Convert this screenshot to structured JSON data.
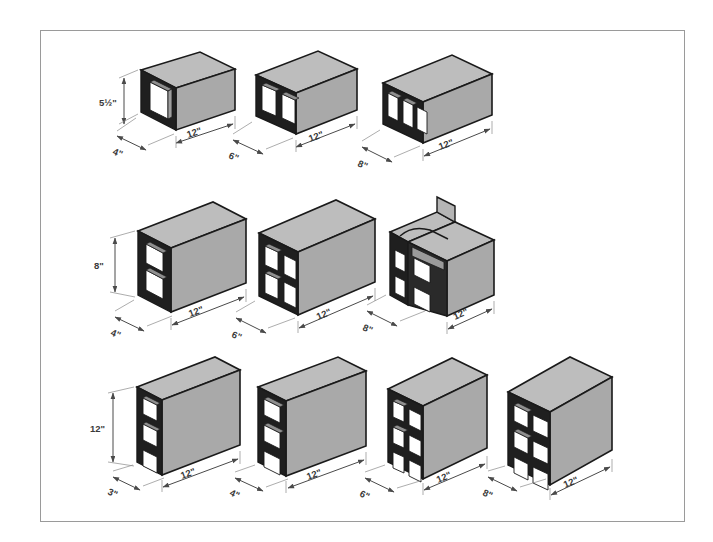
{
  "figure": {
    "frame_color": "#9a9a9a",
    "background_color": "#ffffff",
    "block_face_color": "#a9a9a9",
    "block_top_color": "#bdbdbd",
    "block_side_color": "#9e9e9e",
    "block_outline_color": "#1a1a1a",
    "dimension_text_color": "#3a3a3a"
  },
  "rows": [
    {
      "id": "row-1",
      "orientation": "horizontal",
      "height_label": "5 1/2\"",
      "blocks": [
        {
          "id": "r1-b1",
          "width_label": "4\"",
          "length_label": "12\"",
          "height_label": "5 1/2\"",
          "cells": 1,
          "cell_columns": 1,
          "cell_rows": 1,
          "type": "stretcher"
        },
        {
          "id": "r1-b2",
          "width_label": "6\"",
          "length_label": "12\"",
          "height_label": "5 1/2\"",
          "cells": 2,
          "cell_columns": 2,
          "cell_rows": 1,
          "type": "stretcher"
        },
        {
          "id": "r1-b3",
          "width_label": "8\"",
          "length_label": "12\"",
          "height_label": "5 1/2\"",
          "cells": 3,
          "cell_columns": 3,
          "cell_rows": 1,
          "type": "stretcher"
        }
      ]
    },
    {
      "id": "row-2",
      "orientation": "upright",
      "height_label": "8\"",
      "blocks": [
        {
          "id": "r2-b1",
          "width_label": "4\"",
          "length_label": "12\"",
          "height_label": "8\"",
          "cells": 2,
          "cell_columns": 1,
          "cell_rows": 2,
          "type": "stretcher"
        },
        {
          "id": "r2-b2",
          "width_label": "6\"",
          "length_label": "12\"",
          "height_label": "8\"",
          "cells": 4,
          "cell_columns": 2,
          "cell_rows": 2,
          "type": "stretcher"
        },
        {
          "id": "r2-b3",
          "width_label": "8\"",
          "length_label": "12\"",
          "height_label": "8\"",
          "cells": 4,
          "cell_columns": 2,
          "cell_rows": 2,
          "type": "bond-beam"
        }
      ]
    },
    {
      "id": "row-3",
      "orientation": "upright",
      "height_label": "12\"",
      "blocks": [
        {
          "id": "r3-b1",
          "width_label": "3\"",
          "length_label": "12\"",
          "height_label": "12\"",
          "cells": 3,
          "cell_columns": 1,
          "cell_rows": 3,
          "type": "stretcher"
        },
        {
          "id": "r3-b2",
          "width_label": "4\"",
          "length_label": "12\"",
          "height_label": "12\"",
          "cells": 3,
          "cell_columns": 1,
          "cell_rows": 3,
          "type": "stretcher"
        },
        {
          "id": "r3-b3",
          "width_label": "6\"",
          "length_label": "12\"",
          "height_label": "12\"",
          "cells": 6,
          "cell_columns": 2,
          "cell_rows": 3,
          "type": "stretcher"
        },
        {
          "id": "r3-b4",
          "width_label": "8\"",
          "length_label": "12\"",
          "height_label": "12\"",
          "cells": 6,
          "cell_columns": 2,
          "cell_rows": 3,
          "type": "stretcher"
        }
      ]
    }
  ],
  "labels": {
    "r1b1_h": "5½\"",
    "r1b1_w": "4\"",
    "r1b1_l": "12\"",
    "r1b2_w": "6\"",
    "r1b2_l": "12\"",
    "r1b3_w": "8\"",
    "r1b3_l": "12\"",
    "r2b1_h": "8\"",
    "r2b1_w": "4\"",
    "r2b1_l": "12\"",
    "r2b2_w": "6\"",
    "r2b2_l": "12\"",
    "r2b3_w": "8\"",
    "r2b3_l": "12\"",
    "r3b1_h": "12\"",
    "r3b1_w": "3\"",
    "r3b1_l": "12\"",
    "r3b2_w": "4\"",
    "r3b2_l": "12\"",
    "r3b3_w": "6\"",
    "r3b3_l": "12\"",
    "r3b4_w": "8\"",
    "r3b4_l": "12\""
  }
}
